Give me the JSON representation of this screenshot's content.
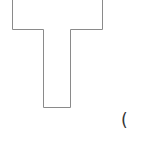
{
  "diagram": {
    "shape": {
      "type": "t-shape-outline",
      "stroke_color": "#8a8a8a",
      "fill_color": "#ffffff"
    },
    "label": {
      "text": "("
    }
  }
}
